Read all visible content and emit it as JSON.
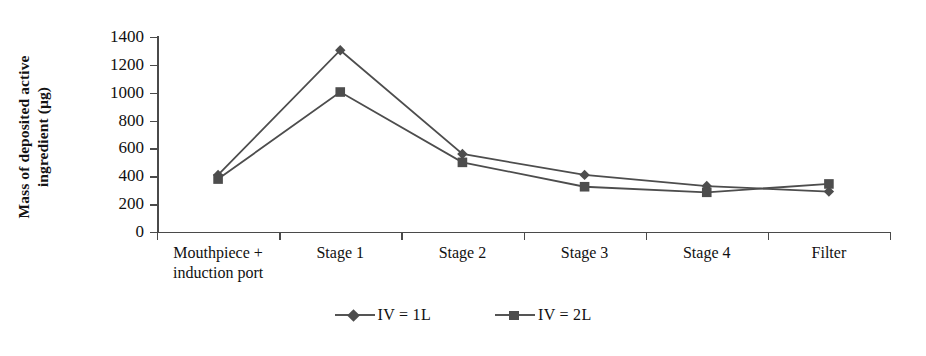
{
  "chart_data": {
    "type": "line",
    "title": "",
    "xlabel": "",
    "ylabel": "Mass of deposited active\ningredient (µg)",
    "ylim": [
      0,
      1400
    ],
    "yticks": [
      0,
      200,
      400,
      600,
      800,
      1000,
      1200,
      1400
    ],
    "grid": false,
    "legend_position": "bottom-center",
    "categories": [
      "Mouthpiece +\ninduction port",
      "Stage 1",
      "Stage 2",
      "Stage 3",
      "Stage 4",
      "Filter"
    ],
    "series": [
      {
        "name": "IV = 1L",
        "marker": "diamond",
        "color": "#4d4d4d",
        "values": [
          410,
          1305,
          560,
          410,
          330,
          290
        ]
      },
      {
        "name": "IV = 2L",
        "marker": "square",
        "color": "#4d4d4d",
        "values": [
          380,
          1005,
          500,
          325,
          285,
          345
        ]
      }
    ]
  },
  "axis": {
    "y_tick_labels": [
      "1400",
      "1200",
      "1000",
      "800",
      "600",
      "400",
      "200",
      "0"
    ],
    "y_title_line1": "Mass of deposited active",
    "y_title_line2": "ingredient (µg)"
  },
  "legend": {
    "items": [
      {
        "label": "IV = 1L",
        "marker": "diamond-marker"
      },
      {
        "label": "IV = 2L",
        "marker": "square-marker"
      }
    ]
  },
  "colors": {
    "series_gray": "#4d4d4d",
    "axis_gray": "#4a4a4a",
    "text": "#111111"
  }
}
